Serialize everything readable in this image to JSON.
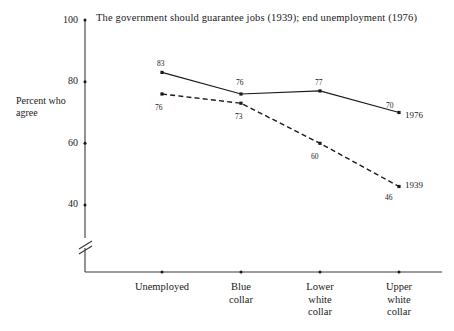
{
  "chart_data": {
    "type": "line",
    "title": "The government should guarantee jobs (1939); end unemployment (1976)",
    "xlabel": "",
    "ylabel": "Percent who\nagree",
    "ylabel_line1": "Percent who",
    "ylabel_line2": "agree",
    "categories": [
      "Unemployed",
      "Blue collar",
      "Lower white collar",
      "Upper white collar"
    ],
    "category_lines": [
      [
        "Unemployed"
      ],
      [
        "Blue",
        "collar"
      ],
      [
        "Lower",
        "white",
        "collar"
      ],
      [
        "Upper",
        "white",
        "collar"
      ]
    ],
    "series": [
      {
        "name": "1976",
        "style": "solid",
        "values": [
          83,
          76,
          77,
          70
        ],
        "labels": [
          "83",
          "76",
          "77",
          "70"
        ]
      },
      {
        "name": "1939",
        "style": "dashed",
        "values": [
          76,
          73,
          60,
          46
        ],
        "labels": [
          "76",
          "73",
          "60",
          "46"
        ]
      }
    ],
    "yticks": [
      100,
      80,
      60,
      40
    ],
    "ytick_labels": [
      "100",
      "80",
      "60",
      "40"
    ],
    "ylim": [
      40,
      100
    ],
    "axis_break": true,
    "grid": false,
    "legend_position": "inline-right-of-last-point",
    "colors": {
      "line": "#1a1a1a",
      "background": "#ffffff",
      "axis": "#3a3a3a"
    }
  },
  "labels": {
    "y_axis_title_line1": "Percent who",
    "y_axis_title_line2": "agree",
    "ytick_100": "100",
    "ytick_80": "80",
    "ytick_60": "60",
    "ytick_40": "40",
    "cat1_l1": "Unemployed",
    "cat2_l1": "Blue",
    "cat2_l2": "collar",
    "cat3_l1": "Lower",
    "cat3_l2": "white",
    "cat3_l3": "collar",
    "cat4_l1": "Upper",
    "cat4_l2": "white",
    "cat4_l3": "collar",
    "s1_p1": "83",
    "s1_p2": "76",
    "s1_p3": "77",
    "s1_p4": "70",
    "s2_p1": "76",
    "s2_p2": "73",
    "s2_p3": "60",
    "s2_p4": "46",
    "series1_name": "1976",
    "series2_name": "1939"
  }
}
